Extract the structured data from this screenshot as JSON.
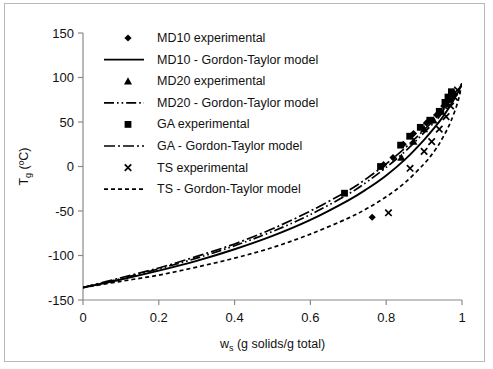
{
  "chart_data": {
    "type": "scatter",
    "title": "",
    "xlabel": "w_s (g solids/g total)",
    "xlabel_main": "w",
    "xlabel_sub": "s",
    "xlabel_rest": " (g solids/g total)",
    "ylabel": "Tg (ºC)",
    "ylabel_main": "T",
    "ylabel_sub": "g",
    "ylabel_rest": " (ºC)",
    "xlim": [
      0,
      1
    ],
    "ylim": [
      -150,
      150
    ],
    "xticks": [
      "0",
      "0.2",
      "0.4",
      "0.6",
      "0.8",
      "1"
    ],
    "xtick_values": [
      0,
      0.2,
      0.4,
      0.6,
      0.8,
      1
    ],
    "yticks": [
      "150",
      "100",
      "50",
      "0",
      "-50",
      "-100",
      "-150"
    ],
    "ytick_values": [
      150,
      100,
      50,
      0,
      -50,
      -100,
      -150
    ],
    "grid": false,
    "legend_position": "upper-left-inside",
    "series": [
      {
        "name": "MD10 experimental",
        "kind": "scatter",
        "marker": "diamond",
        "color": "#000000",
        "points": [
          [
            0.763,
            -57
          ],
          [
            0.793,
            2
          ],
          [
            0.818,
            10
          ],
          [
            0.845,
            25
          ],
          [
            0.872,
            37
          ],
          [
            0.906,
            49
          ],
          [
            0.933,
            58
          ],
          [
            0.952,
            68
          ],
          [
            0.964,
            74
          ],
          [
            0.975,
            80
          ]
        ]
      },
      {
        "name": "MD10 - Gordon-Taylor model",
        "kind": "line",
        "style": "solid",
        "color": "#000000",
        "points": [
          [
            0.0,
            -136
          ],
          [
            0.1,
            -127
          ],
          [
            0.2,
            -117
          ],
          [
            0.3,
            -106
          ],
          [
            0.4,
            -93
          ],
          [
            0.5,
            -78
          ],
          [
            0.6,
            -60
          ],
          [
            0.7,
            -38
          ],
          [
            0.75,
            -25
          ],
          [
            0.8,
            -10
          ],
          [
            0.85,
            8
          ],
          [
            0.9,
            30
          ],
          [
            0.93,
            45
          ],
          [
            0.95,
            56
          ],
          [
            0.97,
            69
          ],
          [
            0.99,
            84
          ],
          [
            1.0,
            93
          ]
        ]
      },
      {
        "name": "MD20 experimental",
        "kind": "scatter",
        "marker": "triangle",
        "color": "#000000",
        "points": [
          [
            0.84,
            10
          ],
          [
            0.872,
            28
          ],
          [
            0.9,
            42
          ],
          [
            0.925,
            52
          ],
          [
            0.945,
            62
          ],
          [
            0.958,
            70
          ],
          [
            0.968,
            76
          ],
          [
            0.978,
            83
          ]
        ]
      },
      {
        "name": "MD20 - Gordon-Taylor model",
        "kind": "line",
        "style": "dashdotdot",
        "color": "#000000",
        "points": [
          [
            0.0,
            -136
          ],
          [
            0.1,
            -126
          ],
          [
            0.2,
            -115
          ],
          [
            0.3,
            -103
          ],
          [
            0.4,
            -89
          ],
          [
            0.5,
            -73
          ],
          [
            0.6,
            -54
          ],
          [
            0.7,
            -31
          ],
          [
            0.75,
            -17
          ],
          [
            0.8,
            -1
          ],
          [
            0.85,
            17
          ],
          [
            0.9,
            38
          ],
          [
            0.93,
            51
          ],
          [
            0.95,
            61
          ],
          [
            0.97,
            72
          ],
          [
            0.99,
            85
          ],
          [
            1.0,
            92
          ]
        ]
      },
      {
        "name": "GA experimental",
        "kind": "scatter",
        "marker": "square",
        "color": "#000000",
        "points": [
          [
            0.69,
            -30
          ],
          [
            0.785,
            0
          ],
          [
            0.838,
            24
          ],
          [
            0.862,
            34
          ],
          [
            0.89,
            44
          ],
          [
            0.915,
            52
          ],
          [
            0.94,
            62
          ],
          [
            0.955,
            72
          ],
          [
            0.963,
            78
          ],
          [
            0.972,
            84
          ]
        ]
      },
      {
        "name": "GA - Gordon-Taylor model",
        "kind": "line",
        "style": "dashdot",
        "color": "#000000",
        "points": [
          [
            0.0,
            -136
          ],
          [
            0.1,
            -125
          ],
          [
            0.2,
            -114
          ],
          [
            0.3,
            -101
          ],
          [
            0.4,
            -87
          ],
          [
            0.5,
            -70
          ],
          [
            0.6,
            -50
          ],
          [
            0.7,
            -27
          ],
          [
            0.75,
            -13
          ],
          [
            0.8,
            3
          ],
          [
            0.85,
            21
          ],
          [
            0.9,
            41
          ],
          [
            0.93,
            54
          ],
          [
            0.95,
            63
          ],
          [
            0.97,
            73
          ],
          [
            0.99,
            86
          ],
          [
            1.0,
            93
          ]
        ]
      },
      {
        "name": "TS experimental",
        "kind": "scatter",
        "marker": "cross",
        "color": "#000000",
        "points": [
          [
            0.806,
            -52
          ],
          [
            0.863,
            -2
          ],
          [
            0.9,
            17
          ],
          [
            0.92,
            28
          ],
          [
            0.94,
            42
          ],
          [
            0.958,
            56
          ],
          [
            0.97,
            68
          ],
          [
            0.98,
            78
          ],
          [
            0.988,
            86
          ]
        ]
      },
      {
        "name": "TS - Gordon-Taylor model",
        "kind": "line",
        "style": "dashed",
        "color": "#000000",
        "points": [
          [
            0.0,
            -136
          ],
          [
            0.1,
            -129
          ],
          [
            0.2,
            -122
          ],
          [
            0.3,
            -113
          ],
          [
            0.4,
            -103
          ],
          [
            0.5,
            -91
          ],
          [
            0.6,
            -76
          ],
          [
            0.7,
            -58
          ],
          [
            0.75,
            -47
          ],
          [
            0.8,
            -34
          ],
          [
            0.85,
            -18
          ],
          [
            0.9,
            3
          ],
          [
            0.93,
            19
          ],
          [
            0.95,
            33
          ],
          [
            0.97,
            50
          ],
          [
            0.99,
            74
          ],
          [
            1.0,
            95
          ]
        ]
      }
    ],
    "legend_entries": [
      {
        "label": "MD10 experimental",
        "type": "marker",
        "marker": "diamond"
      },
      {
        "label": "MD10 - Gordon-Taylor model",
        "type": "line",
        "style": "solid"
      },
      {
        "label": "MD20 experimental",
        "type": "marker",
        "marker": "triangle"
      },
      {
        "label": "MD20 - Gordon-Taylor model",
        "type": "line",
        "style": "dashdotdot"
      },
      {
        "label": "GA experimental",
        "type": "marker",
        "marker": "square"
      },
      {
        "label": "GA - Gordon-Taylor model",
        "type": "line",
        "style": "dashdot"
      },
      {
        "label": "TS experimental",
        "type": "marker",
        "marker": "cross"
      },
      {
        "label": "TS - Gordon-Taylor model",
        "type": "line",
        "style": "dashed"
      }
    ]
  }
}
